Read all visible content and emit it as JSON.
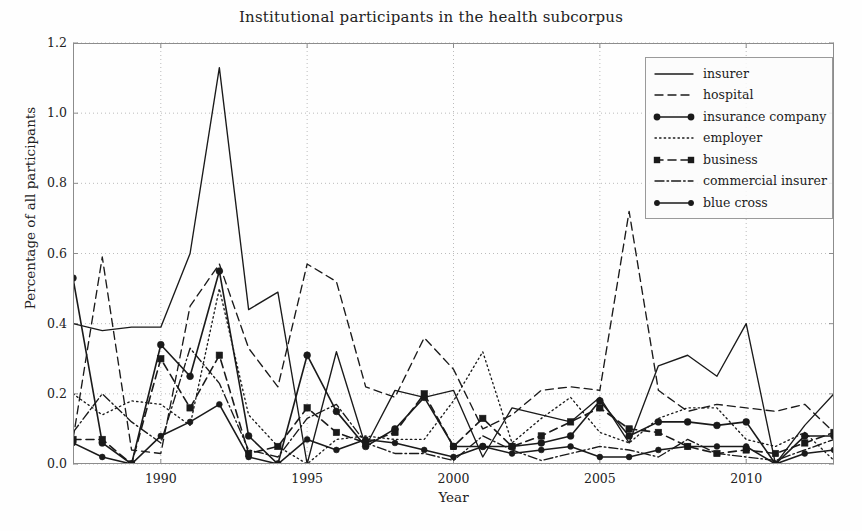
{
  "chart_data": {
    "type": "line",
    "title": "Institutional participants in the health subcorpus",
    "xlabel": "Year",
    "ylabel": "Percentage of all participants",
    "xlim": [
      1987,
      1913
    ],
    "x_min": 1987,
    "x_max": 2013,
    "ylim": [
      0.0,
      1.2
    ],
    "ytick_values": [
      "0.0",
      "0.2",
      "0.4",
      "0.6",
      "0.8",
      "1.0",
      "1.2"
    ],
    "xtick_values": [
      "1990",
      "1995",
      "2000",
      "2005",
      "2010"
    ],
    "grid": true,
    "legend_position": "top-right",
    "x": [
      1987,
      1988,
      1989,
      1990,
      1991,
      1992,
      1993,
      1994,
      1995,
      1996,
      1997,
      1998,
      1999,
      2000,
      2001,
      2002,
      2003,
      2004,
      2005,
      2006,
      2007,
      2008,
      2009,
      2010,
      2011,
      2012,
      2013
    ],
    "series": [
      {
        "name": "insurer",
        "style": "solid",
        "marker": "none",
        "values": [
          0.4,
          0.38,
          0.39,
          0.39,
          0.6,
          1.13,
          0.44,
          0.49,
          0.0,
          0.32,
          0.05,
          0.21,
          0.19,
          0.21,
          0.02,
          0.16,
          0.14,
          0.12,
          0.19,
          0.06,
          0.28,
          0.31,
          0.25,
          0.4,
          0.0,
          0.11,
          0.2
        ]
      },
      {
        "name": "hospital",
        "style": "dashed",
        "marker": "none",
        "values": [
          0.07,
          0.59,
          0.04,
          0.03,
          0.45,
          0.57,
          0.33,
          0.22,
          0.57,
          0.52,
          0.22,
          0.19,
          0.36,
          0.27,
          0.1,
          0.14,
          0.21,
          0.22,
          0.21,
          0.72,
          0.21,
          0.15,
          0.17,
          0.16,
          0.15,
          0.17,
          0.09
        ]
      },
      {
        "name": "insurance company",
        "style": "solid",
        "marker": "circle",
        "values": [
          0.53,
          0.06,
          0.0,
          0.34,
          0.25,
          0.55,
          0.08,
          0.0,
          0.31,
          0.15,
          0.05,
          0.1,
          0.19,
          0.05,
          0.05,
          0.05,
          0.06,
          0.08,
          0.18,
          0.08,
          0.12,
          0.12,
          0.11,
          0.12,
          0.0,
          0.08,
          0.08
        ]
      },
      {
        "name": "employer",
        "style": "dotted",
        "marker": "none",
        "values": [
          0.2,
          0.14,
          0.18,
          0.17,
          0.11,
          0.5,
          0.14,
          0.05,
          0.0,
          0.07,
          0.08,
          0.07,
          0.07,
          0.18,
          0.32,
          0.06,
          0.13,
          0.19,
          0.09,
          0.06,
          0.13,
          0.16,
          0.16,
          0.07,
          0.05,
          0.09,
          0.01
        ]
      },
      {
        "name": "business",
        "style": "dashed",
        "marker": "square",
        "values": [
          0.07,
          0.07,
          0.0,
          0.3,
          0.16,
          0.31,
          0.03,
          0.05,
          0.16,
          0.09,
          0.06,
          0.09,
          0.2,
          0.05,
          0.13,
          0.05,
          0.08,
          0.12,
          0.16,
          0.1,
          0.09,
          0.05,
          0.03,
          0.04,
          0.03,
          0.06,
          0.09
        ]
      },
      {
        "name": "commercial insurer",
        "style": "dashdot",
        "marker": "none",
        "values": [
          0.09,
          0.2,
          0.12,
          0.06,
          0.33,
          0.23,
          0.04,
          0.02,
          0.13,
          0.17,
          0.06,
          0.03,
          0.03,
          0.01,
          0.08,
          0.04,
          0.01,
          0.03,
          0.05,
          0.04,
          0.02,
          0.07,
          0.03,
          0.02,
          0.01,
          0.04,
          0.07
        ]
      },
      {
        "name": "blue cross",
        "style": "solid",
        "marker": "circle-small",
        "values": [
          0.06,
          0.02,
          0.0,
          0.08,
          0.12,
          0.17,
          0.02,
          0.0,
          0.07,
          0.04,
          0.07,
          0.06,
          0.04,
          0.02,
          0.05,
          0.03,
          0.04,
          0.05,
          0.02,
          0.02,
          0.04,
          0.05,
          0.05,
          0.05,
          0.0,
          0.03,
          0.04
        ]
      }
    ]
  },
  "legend": {
    "items": [
      {
        "label": "insurer"
      },
      {
        "label": "hospital"
      },
      {
        "label": "insurance company"
      },
      {
        "label": "employer"
      },
      {
        "label": "business"
      },
      {
        "label": "commercial insurer"
      },
      {
        "label": "blue cross"
      }
    ]
  },
  "colors": {
    "line": "#1a1a1a",
    "grid": "#b4b4b4",
    "axis": "#8c8c8c",
    "background": "#fefefe"
  }
}
